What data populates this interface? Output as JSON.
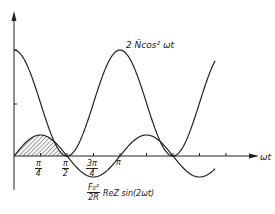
{
  "diagram": {
    "x_axis_label": "ωt",
    "curve_labels": {
      "cos2": "2 N̄cos² ωt",
      "sin_prefix_num": "F₀²",
      "sin_prefix_den": "2R",
      "sin_rest": "ReZ  sin(2ωt)"
    },
    "ticks": [
      {
        "num": "π",
        "den": "4"
      },
      {
        "num": "π",
        "den": "2"
      },
      {
        "num": "3π",
        "den": "4"
      },
      {
        "single": "π"
      }
    ],
    "colors": {
      "line": "#222222",
      "hatch": "#333333",
      "background": "#ffffff"
    }
  },
  "chart_data": {
    "type": "line",
    "title": "",
    "xlabel": "ωt",
    "ylabel": "",
    "series": [
      {
        "name": "2N̄cos²(ωt)",
        "function": "2*N*cos^2(wt)",
        "x_range": [
          0,
          2.55
        ],
        "peaks_at": [
          "0",
          "π"
        ],
        "zeros_at": [
          "π/2",
          "3π/2"
        ]
      },
      {
        "name": "(F0²/2R)·ReZ·sin(2ωt)",
        "function": "A*sin(2wt)",
        "amplitude_relative_to_cos2_peak": 0.2,
        "zeros_at": [
          "0",
          "π/2",
          "π",
          "3π/2"
        ]
      }
    ],
    "x_ticks": [
      "π/4",
      "π/2",
      "3π/4",
      "π"
    ],
    "x_tick_count_total": 8,
    "y_ticks": [
      "mid-height of 2N̄"
    ],
    "shaded_region": {
      "between": [
        "sin curve",
        "x-axis"
      ],
      "x_from": "0",
      "x_to": "π/2",
      "pattern": "hatched"
    },
    "grid": false
  }
}
